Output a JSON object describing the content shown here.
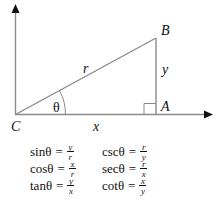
{
  "diagram": {
    "type": "right-triangle-trigonometry",
    "vertices": {
      "C": {
        "label": "C",
        "role": "origin / angle vertex"
      },
      "A": {
        "label": "A",
        "role": "right angle vertex"
      },
      "B": {
        "label": "B",
        "role": "top vertex"
      }
    },
    "sides": {
      "hypotenuse": "r",
      "adjacent": "x",
      "opposite": "y"
    },
    "angle_label": "θ",
    "colors": {
      "line": "#8a8a8a",
      "arrow": "#111111",
      "text": "#111111",
      "background": "#ffffff"
    }
  },
  "formulas": [
    {
      "left": {
        "fn": "sinθ",
        "eq": "=",
        "num": "y",
        "den": "r"
      },
      "right": {
        "fn": "cscθ",
        "eq": "=",
        "num": "r",
        "den": "y"
      }
    },
    {
      "left": {
        "fn": "cosθ",
        "eq": "=",
        "num": "x",
        "den": "r"
      },
      "right": {
        "fn": "secθ",
        "eq": "=",
        "num": "r",
        "den": "x"
      }
    },
    {
      "left": {
        "fn": "tanθ",
        "eq": "=",
        "num": "y",
        "den": "x"
      },
      "right": {
        "fn": "cotθ",
        "eq": "=",
        "num": "x",
        "den": "y"
      }
    }
  ]
}
